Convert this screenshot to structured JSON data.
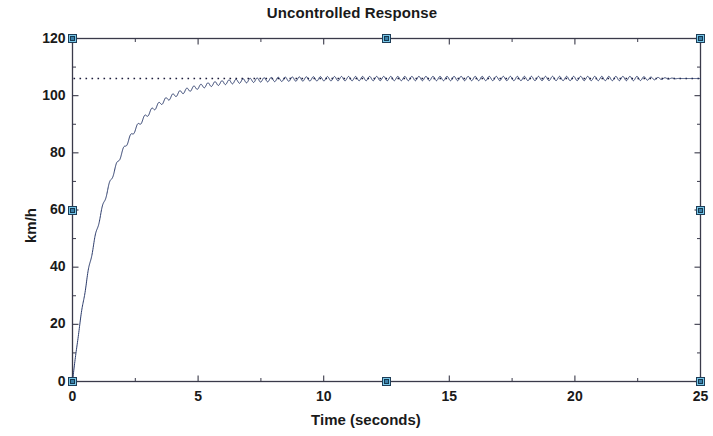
{
  "figure": {
    "title": "Uncontrolled Response",
    "background_color": "#ffffff",
    "edit_mode": true,
    "handle_color": "#77c6e8",
    "handle_border_color": "#1f3d57"
  },
  "axes": {
    "box_color": "#3a3a4a",
    "x_label": "Time (seconds)",
    "y_label": "km/h",
    "x_ticks": [
      0,
      5,
      10,
      15,
      20,
      25
    ],
    "y_ticks": [
      0,
      20,
      40,
      60,
      80,
      100,
      120
    ],
    "x_tick_labels": [
      "0",
      "5",
      "10",
      "15",
      "20",
      "25"
    ],
    "y_tick_labels": [
      "0",
      "20",
      "40",
      "60",
      "80",
      "100",
      "120"
    ]
  },
  "chart_data": {
    "type": "line",
    "title": "Uncontrolled Response",
    "xlabel": "Time (seconds)",
    "ylabel": "km/h",
    "xlim": [
      0,
      25
    ],
    "ylim": [
      0,
      120
    ],
    "grid": false,
    "legend": null,
    "series": [
      {
        "name": "Uncontrolled step response",
        "color": "#2a3a6a",
        "linestyle": "solid",
        "linewidth": 1,
        "description": "First-order step response rising from 0 to steady state 106 km/h with time constant about 1.4 s, superimposed with a small constant-amplitude high-frequency ripple (period about 0.28 s, amplitude about 0.7 km/h).",
        "model": {
          "steady_state": 106,
          "time_constant": 1.4,
          "ripple_amplitude": 0.75,
          "ripple_period": 0.28,
          "ripple_fade_start": 22.5,
          "ripple_fade_end": 24.2
        },
        "x": [
          0,
          0.5,
          1,
          1.5,
          2,
          2.5,
          3,
          3.5,
          4,
          4.5,
          5,
          6,
          7,
          8,
          9,
          10,
          12.5,
          15,
          17.5,
          20,
          22.5,
          25
        ],
        "y": [
          0,
          32.1,
          55.1,
          71.4,
          83.1,
          91.4,
          97.3,
          101.5,
          104.5,
          106.6,
          108.1,
          105.5,
          106.2,
          105.8,
          106.1,
          105.9,
          106.0,
          106.0,
          106.0,
          106.0,
          106.0,
          106.0
        ]
      }
    ],
    "reference_lines": [
      {
        "name": "steady-state-reference",
        "orientation": "horizontal",
        "value": 106,
        "linestyle": "dotted",
        "color": "#1b1b3a"
      }
    ]
  },
  "selection_handles": [
    {
      "name": "handle-top-left",
      "x": 0,
      "y": 120
    },
    {
      "name": "handle-top-center",
      "x": 12.5,
      "y": 120
    },
    {
      "name": "handle-top-right",
      "x": 25,
      "y": 120
    },
    {
      "name": "handle-middle-left",
      "x": 0,
      "y": 60
    },
    {
      "name": "handle-middle-right",
      "x": 25,
      "y": 60
    },
    {
      "name": "handle-bottom-left",
      "x": 0,
      "y": 0
    },
    {
      "name": "handle-bottom-center",
      "x": 12.5,
      "y": 0
    },
    {
      "name": "handle-bottom-right",
      "x": 25,
      "y": 0
    }
  ]
}
